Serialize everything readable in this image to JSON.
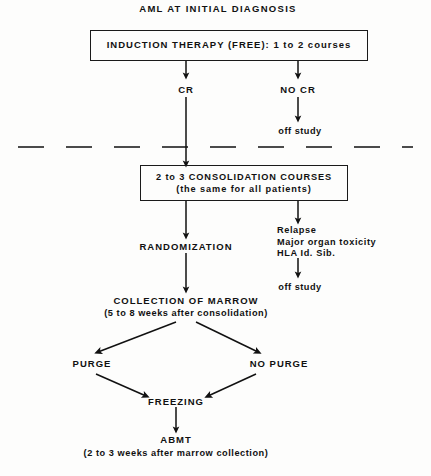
{
  "diagram": {
    "title": "AML AT INITIAL DIAGNOSIS",
    "induction_box": {
      "line1": "INDUCTION THERAPY (FREE): 1 to 2 courses"
    },
    "branch_cr": "CR",
    "branch_no_cr": "NO CR",
    "off_study_1": "off  study",
    "consolidation_box": {
      "line1": "2 to 3 CONSOLIDATION COURSES",
      "line2": "(the  same  for  all  patients)"
    },
    "randomization": "RANDOMIZATION",
    "failure_reasons": {
      "line1": "Relapse",
      "line2": "Major  organ  toxicity",
      "line3": "HLA Id. Sib."
    },
    "off_study_2": "off  study",
    "collection": {
      "line1": "COLLECTION OF MARROW",
      "line2": "(5 to 8  weeks  after  consolidation)"
    },
    "purge": "PURGE",
    "no_purge": "NO PURGE",
    "freezing": "FREEZING",
    "abmt": {
      "line1": "ABMT",
      "line2": "(2  to  3  weeks  after  marrow  collection)"
    },
    "colors": {
      "ink": "#111111",
      "paper": "#fdfdfc"
    }
  }
}
